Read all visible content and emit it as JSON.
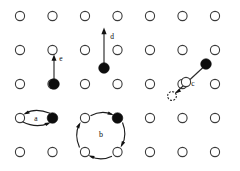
{
  "figure": {
    "width": 240,
    "height": 171,
    "background_color": "#ffffff",
    "lattice": {
      "description": "Square lattice of substrate surface atoms drawn as open circles",
      "rows": 5,
      "columns": 7,
      "site_radius": 4.6,
      "site_fill_color": "#ffffff",
      "site_stroke_color": "#3a3a3a",
      "column_x": [
        20,
        52.5,
        85,
        117.5,
        150,
        182.5,
        215
      ],
      "row_y": [
        16,
        50,
        84,
        118,
        152
      ],
      "occupied_by_adatom": [
        {
          "col": 1,
          "row": 2
        },
        {
          "col": 3,
          "row": 1
        },
        {
          "col": 1,
          "row": 3
        },
        {
          "col": 3,
          "row": 3
        },
        {
          "col": 6,
          "row": 1
        }
      ]
    },
    "adatom": {
      "description": "Adsorbed atom drawn as filled black circle",
      "radius": 5.2,
      "fill_color": "#0d0d0d"
    },
    "ghost_site": {
      "description": "Dashed circle marking a vacated or transient site",
      "radius": 4.4,
      "stroke_color": "#2b2b2b",
      "x": 172,
      "y": 96
    },
    "mechanisms": [
      {
        "label": "a",
        "name": "exchange-hop",
        "label_x": 36,
        "label_y": 121,
        "description": "Double curved two-way arrow between an open lattice site and an adatom in the same row",
        "from": {
          "x": 20,
          "y": 118
        },
        "to": {
          "x": 52.5,
          "y": 118
        },
        "arrow_style": "double-curved"
      },
      {
        "label": "b",
        "name": "cyclic-rotation",
        "label_x": 101,
        "label_y": 137,
        "description": "Closed clockwise loop of four arcs around a square of four sites, one of which holds an adatom",
        "corners": [
          {
            "x": 85,
            "y": 118
          },
          {
            "x": 117.5,
            "y": 118
          },
          {
            "x": 117.5,
            "y": 152
          },
          {
            "x": 85,
            "y": 152
          }
        ],
        "arrow_style": "cyclic-loop"
      },
      {
        "label": "c",
        "name": "diagonal-exchange",
        "label_x": 193,
        "label_y": 86,
        "description": "Diagonal arrow from an adatom down-left through a lattice site to a dashed vacated site",
        "from": {
          "x": 206,
          "y": 64
        },
        "to": {
          "x": 172,
          "y": 96
        },
        "arrow_style": "straight"
      },
      {
        "label": "d",
        "name": "long-jump",
        "label_x": 113,
        "label_y": 39,
        "description": "Long straight upward arrow from an adatom spanning two lattice rows",
        "from": {
          "x": 104,
          "y": 68
        },
        "to": {
          "x": 104,
          "y": 29
        },
        "arrow_style": "straight"
      },
      {
        "label": "e",
        "name": "single-hop",
        "label_x": 61,
        "label_y": 61,
        "description": "Short straight upward arrow from an adatom to the neighbouring lattice row",
        "from": {
          "x": 54,
          "y": 82
        },
        "to": {
          "x": 54,
          "y": 56
        },
        "arrow_style": "straight"
      }
    ]
  }
}
